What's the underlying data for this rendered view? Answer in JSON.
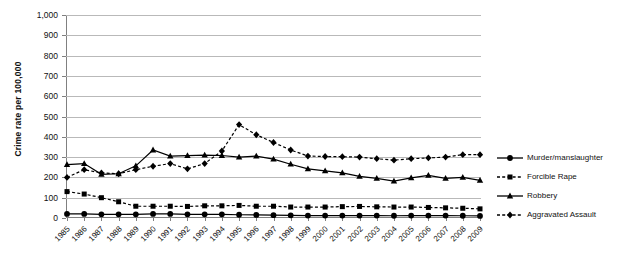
{
  "figure": {
    "caption_fragment": "",
    "ylabel": "Crime rate per 100,000"
  },
  "legend": {
    "position": "right",
    "items": [
      {
        "label": "Murder/manslaughter",
        "marker": "circle",
        "dash": "solid"
      },
      {
        "label": "Forcible Rape",
        "marker": "square",
        "dash": "dashed"
      },
      {
        "label": "Robbery",
        "marker": "triangle",
        "dash": "solid"
      },
      {
        "label": "Aggravated Assault",
        "marker": "diamond",
        "dash": "dashed"
      }
    ]
  },
  "chart_data": {
    "type": "line",
    "title": "",
    "xlabel": "",
    "ylabel": "Crime rate per 100,000",
    "ylim": [
      0,
      1000
    ],
    "ytick_labels": [
      "0",
      "100",
      "200",
      "300",
      "400",
      "500",
      "600",
      "700",
      "800",
      "900",
      "1,000"
    ],
    "ytick_values": [
      0,
      100,
      200,
      300,
      400,
      500,
      600,
      700,
      800,
      900,
      1000
    ],
    "grid": true,
    "categories": [
      "1985",
      "1986",
      "1987",
      "1988",
      "1989",
      "1990",
      "1991",
      "1992",
      "1993",
      "1994",
      "1995",
      "1996",
      "1997",
      "1998",
      "1999",
      "2000",
      "2001",
      "2002",
      "2003",
      "2004",
      "2005",
      "2006",
      "2007",
      "2008",
      "2009"
    ],
    "series": [
      {
        "name": "Murder/manslaughter",
        "color": "#000000",
        "marker": "circle",
        "dash": "solid",
        "values": [
          20,
          20,
          18,
          18,
          18,
          20,
          20,
          18,
          18,
          18,
          16,
          15,
          14,
          13,
          12,
          12,
          12,
          12,
          12,
          11,
          12,
          12,
          12,
          11,
          10
        ]
      },
      {
        "name": "Forcible Rape",
        "color": "#000000",
        "marker": "square",
        "dash": "dashed",
        "values": [
          130,
          118,
          100,
          80,
          58,
          58,
          58,
          57,
          60,
          60,
          62,
          58,
          58,
          54,
          54,
          54,
          56,
          57,
          55,
          54,
          54,
          52,
          50,
          48,
          45
        ]
      },
      {
        "name": "Robbery",
        "color": "#000000",
        "marker": "triangle",
        "dash": "solid",
        "values": [
          263,
          268,
          215,
          218,
          257,
          335,
          305,
          307,
          310,
          308,
          300,
          305,
          290,
          265,
          242,
          232,
          222,
          205,
          195,
          182,
          198,
          210,
          195,
          200,
          185
        ]
      },
      {
        "name": "Aggravated Assault",
        "color": "#000000",
        "marker": "diamond",
        "dash": "dashed",
        "values": [
          200,
          238,
          222,
          218,
          238,
          255,
          268,
          242,
          268,
          330,
          460,
          410,
          372,
          335,
          305,
          303,
          302,
          300,
          292,
          285,
          292,
          296,
          300,
          312,
          312
        ]
      }
    ]
  }
}
